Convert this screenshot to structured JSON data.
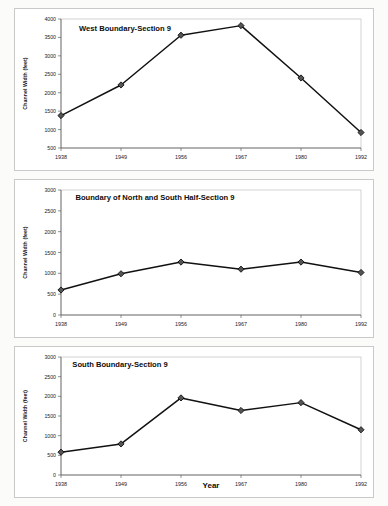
{
  "figure": {
    "background_color": "#fbfbfa",
    "panel_background": "#ffffff",
    "line_color": "#111111",
    "marker_fill": "#555555"
  },
  "chart_data": [
    {
      "type": "line",
      "title": "West Boundary-Section 9",
      "xlabel": "",
      "ylabel": "Channel Width (feet)",
      "categories": [
        "1938",
        "1949",
        "1956",
        "1967",
        "1980",
        "1992"
      ],
      "values": [
        1380,
        2210,
        3560,
        3820,
        2400,
        920
      ],
      "ylim": [
        500,
        4000
      ],
      "yticks": [
        500,
        1000,
        1500,
        2000,
        2500,
        3000,
        3500,
        4000
      ],
      "yticklabels": [
        "500",
        "1000",
        "1500",
        "2000",
        "2500",
        "3000",
        "3500",
        "4000"
      ],
      "xticklabels": [
        "1938",
        "1949",
        "1956",
        "1967",
        "1980",
        "1992"
      ],
      "grid": false,
      "legend": "none",
      "marker": "diamond"
    },
    {
      "type": "line",
      "title": "Boundary of North and South Half-Section 9",
      "xlabel": "",
      "ylabel": "Channel Width (feet)",
      "categories": [
        "1938",
        "1949",
        "1956",
        "1967",
        "1980",
        "1992"
      ],
      "values": [
        600,
        990,
        1270,
        1100,
        1270,
        1020
      ],
      "ylim": [
        0,
        3000
      ],
      "yticks": [
        0,
        500,
        1000,
        1500,
        2000,
        2500,
        3000
      ],
      "yticklabels": [
        "0",
        "500",
        "1000",
        "1500",
        "2000",
        "2500",
        "3000"
      ],
      "xticklabels": [
        "1938",
        "1949",
        "1956",
        "1967",
        "1980",
        "1992"
      ],
      "grid": false,
      "legend": "none",
      "marker": "diamond"
    },
    {
      "type": "line",
      "title": "South Boundary-Section 9",
      "xlabel": "Year",
      "ylabel": "Channel Width (feet)",
      "categories": [
        "1938",
        "1949",
        "1956",
        "1967",
        "1980",
        "1992"
      ],
      "values": [
        580,
        790,
        1960,
        1640,
        1840,
        1150
      ],
      "ylim": [
        0,
        3000
      ],
      "yticks": [
        0,
        500,
        1000,
        1500,
        2000,
        2500,
        3000
      ],
      "yticklabels": [
        "0",
        "500",
        "1000",
        "1500",
        "2000",
        "2500",
        "3000"
      ],
      "xticklabels": [
        "1938",
        "1949",
        "1956",
        "1967",
        "1980",
        "1992"
      ],
      "grid": false,
      "legend": "none",
      "marker": "diamond"
    }
  ]
}
